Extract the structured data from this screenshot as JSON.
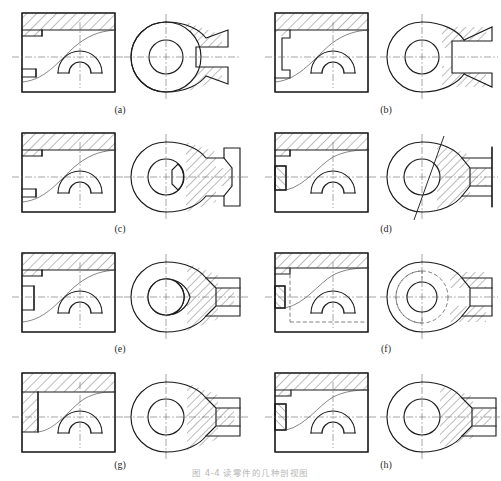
{
  "figure": {
    "caption": "图 4-4  读零件的几种剖视图",
    "page_background": "#ffffff",
    "line_color": "#1d1d1d",
    "centerline_color": "#6a6a6a",
    "hatch_color": "#444444",
    "label_color": "#2a2a2a",
    "total_panels": 8
  },
  "panels": [
    {
      "id": "a",
      "label": "(a)",
      "row": 1,
      "col": 1,
      "front_view": {
        "type": "full-section-rectangle",
        "hatching": "top-band",
        "notches": "left-upper-and-left-lower-steps",
        "internal_curve": "diagonal-spiral",
        "bore": "double-semicircle-arcs"
      },
      "side_view": {
        "type": "circular-boss",
        "outer": "large-circle",
        "center_bore": "circle",
        "slot": "open-right-fork",
        "hatching": "two-angled-wedges",
        "boss_circle": true
      }
    },
    {
      "id": "b",
      "label": "(b)",
      "row": 1,
      "col": 2,
      "front_view": {
        "type": "full-section-rectangle",
        "hatching": "top-band",
        "notches": "left-stepped-tongue",
        "internal_curve": "diagonal-spiral",
        "bore": "double-semicircle-arcs"
      },
      "side_view": {
        "type": "circular-C-shape",
        "outer": "large-circle",
        "center_bore": "circle",
        "slot": "open-right-fork",
        "hatching": "two-angled-wedges",
        "boss_circle": false
      }
    },
    {
      "id": "c",
      "label": "(c)",
      "row": 2,
      "col": 1,
      "front_view": {
        "type": "full-section-rectangle",
        "hatching": "top-band",
        "notches": "left-upper-and-left-lower-steps",
        "internal_curve": "diagonal-spiral",
        "bore": "double-semicircle-arcs"
      },
      "side_view": {
        "type": "circular-boss",
        "outer": "large-circle",
        "center_bore": "circle-with-keyway",
        "slot": "right-rectangular-boss",
        "hatching": "angled-wedges",
        "boss_circle": true
      }
    },
    {
      "id": "d",
      "label": "(d)",
      "row": 2,
      "col": 2,
      "front_view": {
        "type": "full-section-rectangle",
        "hatching": "top-band",
        "notches": "left-narrow-slot",
        "internal_curve": "diagonal-spiral",
        "bore": "double-semicircle-arcs"
      },
      "side_view": {
        "type": "circular-boss",
        "outer": "large-circle",
        "center_bore": "circle",
        "slot": "right-rectangular-boss",
        "hatching": "angled-wedges",
        "cutting_plane": "inclined-line",
        "boss_circle": false
      }
    },
    {
      "id": "e",
      "label": "(e)",
      "row": 3,
      "col": 1,
      "front_view": {
        "type": "full-section-rectangle",
        "hatching": "top-band",
        "notches": "left-upper-and-left-lower-steps",
        "internal_curve": "diagonal-spiral",
        "bore": "double-semicircle-arcs"
      },
      "side_view": {
        "type": "circular-boss",
        "outer": "large-circle",
        "center_bore": "circle",
        "slot": "right-rectangular-boss",
        "hatching": "angled-wedges",
        "boss_circle": false
      }
    },
    {
      "id": "f",
      "label": "(f)",
      "row": 3,
      "col": 2,
      "front_view": {
        "type": "outline-with-hidden-lines",
        "hatching": "top-band",
        "notches": "left-narrow-slot",
        "internal_curve": "diagonal-spiral",
        "hidden_lines": true,
        "bore": "double-semicircle-arcs"
      },
      "side_view": {
        "type": "circular-boss",
        "outer": "large-circle",
        "center_bore": "circle",
        "slot": "right-rectangular-boss",
        "hatching": "angled-wedges",
        "hidden_lines": true,
        "boss_circle": true
      }
    },
    {
      "id": "g",
      "label": "(g)",
      "row": 4,
      "col": 1,
      "front_view": {
        "type": "full-section-rectangle",
        "hatching": "top-band-and-left-band",
        "notches": "left-tall-band",
        "internal_curve": "diagonal-spiral",
        "bore": "double-semicircle-arcs"
      },
      "side_view": {
        "type": "circular-boss",
        "outer": "large-circle",
        "center_bore": "circle",
        "slot": "right-rectangular-boss",
        "hatching": "angled-wedges",
        "boss_circle": false
      }
    },
    {
      "id": "h",
      "label": "(h)",
      "row": 4,
      "col": 2,
      "front_view": {
        "type": "full-section-rectangle",
        "hatching": "top-band-and-left-band",
        "notches": "left-tall-band",
        "internal_curve": "diagonal-spiral",
        "bore": "double-semicircle-arcs"
      },
      "side_view": {
        "type": "circular-boss",
        "outer": "large-circle",
        "center_bore": "circle",
        "slot": "right-rectangular-boss",
        "hatching": "angled-wedges",
        "boss_circle": false
      }
    }
  ]
}
